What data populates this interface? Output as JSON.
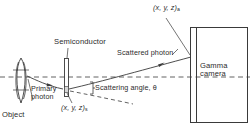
{
  "diagram": {
    "type": "schematic",
    "background_color": "#ffffff",
    "stroke_color": "#3a3a3a",
    "text_color": "#2b2b2b",
    "labels": {
      "semiconductor": "Semiconductor",
      "scattered_photon": "Scattered photon",
      "gamma_camera_line1": "Gamma",
      "gamma_camera_line2": "camera",
      "primary_photon_line1": "Primary",
      "primary_photon_line2": "photon",
      "object": "Object",
      "scattering_angle": "Scattering angle, θ",
      "coord_absorption": "(x, y, z)",
      "coord_absorption_sub": "a",
      "coord_scatter": "(x, y, z)",
      "coord_scatter_sub": "s"
    },
    "elements": [
      {
        "name": "object-ellipse",
        "shape": "lens",
        "x": 14,
        "y": 58,
        "w": 14,
        "h": 46
      },
      {
        "name": "semiconductor-detector",
        "shape": "thin-rectangle",
        "x": 64,
        "y": 58,
        "w": 5,
        "h": 38
      },
      {
        "name": "gamma-camera-body",
        "shape": "rectangle",
        "x": 190,
        "y": 27,
        "w": 58,
        "h": 96
      },
      {
        "name": "gamma-camera-crystal-strip",
        "shape": "thin-rectangle",
        "x": 190,
        "y": 27,
        "w": 6,
        "h": 96
      },
      {
        "name": "axis-dashed-line",
        "shape": "dashed-horizontal",
        "y": 77
      },
      {
        "name": "primary-photon-ray",
        "shape": "arrow-right"
      },
      {
        "name": "scattered-photon-ray",
        "shape": "arrow-up-right"
      },
      {
        "name": "undeviated-path-dashed",
        "shape": "dashed-down-right"
      },
      {
        "name": "angle-bracket",
        "shape": "brace"
      }
    ]
  }
}
